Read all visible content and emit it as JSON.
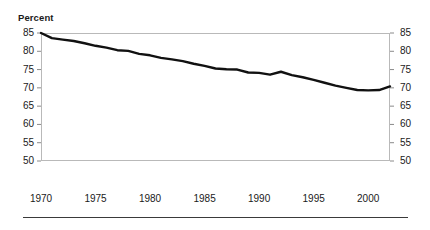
{
  "figure": {
    "y_axis_caption": "Percent",
    "background_color": "#ffffff",
    "line_color": "#111111",
    "frame_color": "#b9b9b9",
    "rule_color": "#3a3a3a"
  },
  "chart_data": {
    "type": "line",
    "title": "",
    "subtitle": "",
    "xlabel": "",
    "ylabel": "Percent",
    "xlim": [
      1970,
      2002
    ],
    "ylim": [
      50,
      85
    ],
    "grid": false,
    "legend": "none",
    "y_ticks": [
      50,
      55,
      60,
      65,
      70,
      75,
      80,
      85
    ],
    "y_tick_labels": [
      "50",
      "55",
      "60",
      "65",
      "70",
      "75",
      "80",
      "85"
    ],
    "y_axis_duplicated_right": true,
    "x_ticks": [
      1970,
      1975,
      1980,
      1985,
      1990,
      1995,
      2000
    ],
    "x_tick_labels": [
      "1970",
      "1975",
      "1980",
      "1985",
      "1990",
      "1995",
      "2000"
    ],
    "series": [
      {
        "name": "Percent",
        "x": [
          1970,
          1971,
          1972,
          1973,
          1974,
          1975,
          1976,
          1977,
          1978,
          1979,
          1980,
          1981,
          1982,
          1983,
          1984,
          1985,
          1986,
          1987,
          1988,
          1989,
          1990,
          1991,
          1992,
          1993,
          1994,
          1995,
          1996,
          1997,
          1998,
          1999,
          2000,
          2001,
          2002
        ],
        "values": [
          85.0,
          83.6,
          83.2,
          82.8,
          82.2,
          81.5,
          81.0,
          80.3,
          80.1,
          79.3,
          78.9,
          78.2,
          77.8,
          77.3,
          76.6,
          76.0,
          75.3,
          75.1,
          75.0,
          74.2,
          74.1,
          73.6,
          74.4,
          73.5,
          72.9,
          72.2,
          71.4,
          70.6,
          70.0,
          69.4,
          69.3,
          69.4,
          70.4
        ]
      }
    ]
  },
  "axis_labels": {
    "y_left": [
      "85",
      "80",
      "75",
      "70",
      "65",
      "60",
      "55",
      "50"
    ],
    "y_right": [
      "85",
      "80",
      "75",
      "70",
      "65",
      "60",
      "55",
      "50"
    ],
    "x": [
      "1970",
      "1975",
      "1980",
      "1985",
      "1990",
      "1995",
      "2000"
    ]
  }
}
